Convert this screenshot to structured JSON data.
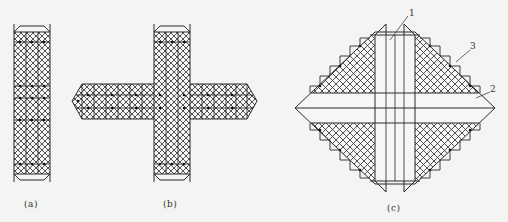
{
  "figure": {
    "panels": [
      {
        "id": "a",
        "caption": "(a)",
        "description": "Single vertical lattice strip with chamfered end caps"
      },
      {
        "id": "b",
        "caption": "(b)",
        "description": "Cross-shaped lattice: vertical strip crossed by horizontal strip with pointed ends"
      },
      {
        "id": "c",
        "caption": "(c)",
        "description": "Diamond-shaped panel with crosshatched quadrants, open vertical and horizontal strips"
      }
    ],
    "callouts": [
      {
        "label": "1",
        "target": "vertical strip"
      },
      {
        "label": "2",
        "target": "horizontal band"
      },
      {
        "label": "3",
        "target": "crosshatched lattice region"
      }
    ],
    "colors": {
      "line": "#2a2a2a",
      "background": "#f4f4f2",
      "fill": "#ffffff"
    }
  }
}
